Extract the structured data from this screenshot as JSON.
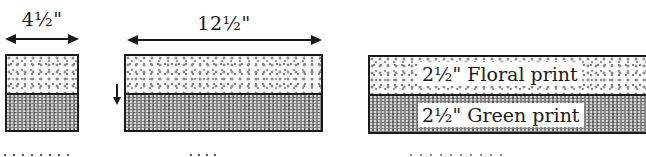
{
  "panels": [
    {
      "id": "left",
      "dimension_label": "4½\"",
      "strips": [
        "floral",
        "green"
      ]
    },
    {
      "id": "middle",
      "dimension_label": "12½\"",
      "press_direction": "down",
      "strips": [
        "floral",
        "green"
      ]
    },
    {
      "id": "right",
      "strips": [
        {
          "label": "2½\" Floral print",
          "fabric": "floral"
        },
        {
          "label": "2½\" Green print",
          "fabric": "green"
        }
      ]
    }
  ],
  "colors": {
    "line": "#1a1a1a",
    "floral_bg": "#fbfbfb",
    "floral_dots": "#8a8a8a",
    "green_bg": "#858585"
  }
}
